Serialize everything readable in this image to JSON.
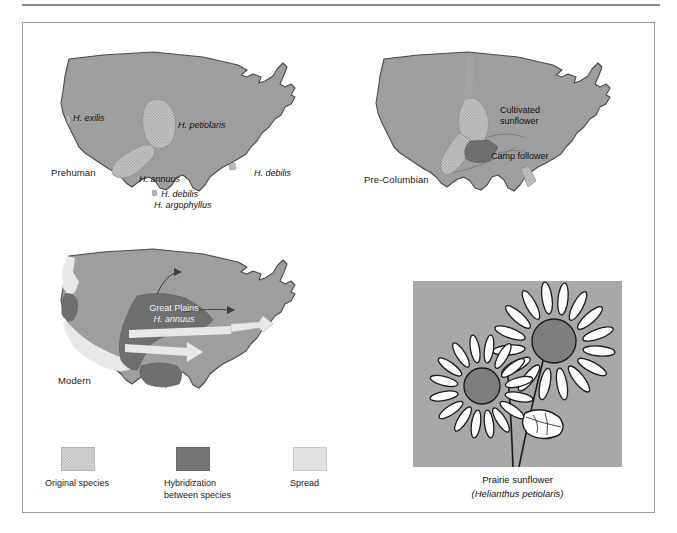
{
  "figure": {
    "panels": [
      {
        "id": "prehuman",
        "era_label": "Prehuman",
        "labels": [
          "H. exilis",
          "H. petiolaris",
          "H. annuus",
          "H. debilis",
          "H. argophyllus",
          "H. debilis"
        ]
      },
      {
        "id": "pre-columbian",
        "era_label": "Pre-Columbian",
        "labels": [
          "Cultivated",
          "sunflower",
          "Camp follower"
        ]
      },
      {
        "id": "modern",
        "era_label": "Modern",
        "labels": [
          "Great Plains",
          "H. annuus"
        ]
      }
    ],
    "legend": {
      "items": [
        {
          "label": "Original species",
          "swatch": "original-species-swatch"
        },
        {
          "label": "Hybridization\nbetween species",
          "swatch": "hybridization-swatch"
        },
        {
          "label": "Spread",
          "swatch": "spread-swatch"
        }
      ]
    },
    "photo": {
      "common_name": "Prairie sunflower",
      "scientific_name": "(Helianthus petiolaris)"
    }
  },
  "colors": {
    "map_base": "#9e9e9e",
    "map_outline": "#4a4a4a",
    "hybridization": "#757575",
    "spread": "#e8e8e8",
    "original_species": "#b9b9b9",
    "photo_background": "#a8a8a8",
    "frame_border": "#9a9a9a",
    "rule": "#8d8d8d"
  }
}
